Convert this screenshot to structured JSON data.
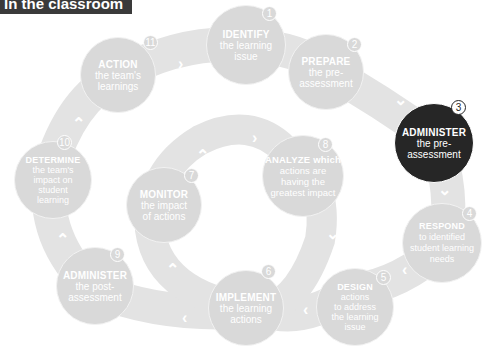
{
  "banner": {
    "title": "In the classroom"
  },
  "colors": {
    "step_fill": "#d9d9d9",
    "active_fill": "#262626",
    "path": "#e3e3e3",
    "text": "#ffffff",
    "banner": "#3a3a3a"
  },
  "steps": [
    {
      "number": "1",
      "verb": "IDENTIFY",
      "rest": [
        "the learning",
        "issue"
      ]
    },
    {
      "number": "2",
      "verb": "PREPARE",
      "rest": [
        "the pre-",
        "assessment"
      ]
    },
    {
      "number": "3",
      "verb": "ADMINISTER",
      "rest": [
        "the pre-",
        "assessment"
      ],
      "active": true
    },
    {
      "number": "4",
      "verb": "RESPOND",
      "rest": [
        "to identified",
        "student learning",
        "needs"
      ]
    },
    {
      "number": "5",
      "verb": "DESIGN",
      "rest": [
        "actions",
        "to address",
        "the learning",
        "issue"
      ]
    },
    {
      "number": "6",
      "verb": "IMPLEMENT",
      "rest": [
        "the learning",
        "actions"
      ]
    },
    {
      "number": "7",
      "verb": "MONITOR",
      "rest": [
        "the impact",
        "of actions"
      ]
    },
    {
      "number": "8",
      "verb": "ANALYZE which",
      "rest": [
        "actions are",
        "having the",
        "greatest impact"
      ]
    },
    {
      "number": "9",
      "verb": "ADMINISTER",
      "rest": [
        "the post-",
        "assessment"
      ]
    },
    {
      "number": "10",
      "verb": "DETERMINE",
      "rest": [
        "the team's",
        "impact on",
        "student",
        "learning"
      ]
    },
    {
      "number": "11",
      "verb": "ACTION",
      "rest": [
        "the team's",
        "learnings"
      ]
    }
  ],
  "arrows": {
    "right": "›",
    "down": "⌄",
    "left": "‹",
    "up": "⌃"
  }
}
